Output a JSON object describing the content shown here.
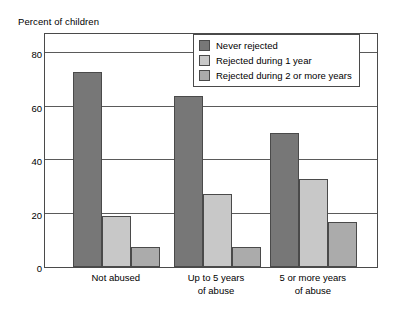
{
  "chart_data": {
    "type": "bar",
    "title": "",
    "ylabel": "Percent of children",
    "xlabel": "",
    "ylim": [
      0,
      88
    ],
    "yticks": [
      0,
      20,
      40,
      60,
      80
    ],
    "ytick_labels": [
      "0",
      "20",
      "40",
      "60",
      "80"
    ],
    "grid": true,
    "legend_position": "top-right inside plot area",
    "categories": [
      "Not abused",
      "Up to 5 years of abuse",
      "5 or more years of abuse"
    ],
    "category_lines": [
      [
        "Not abused"
      ],
      [
        "Up to 5 years",
        "of abuse"
      ],
      [
        "5 or more years",
        "of abuse"
      ]
    ],
    "series": [
      {
        "name": "Never rejected",
        "color": "#777777",
        "values": [
          73,
          64,
          50
        ]
      },
      {
        "name": "Rejected during 1 year",
        "color": "#c8c8c8",
        "values": [
          19,
          27.5,
          33
        ]
      },
      {
        "name": "Rejected during 2 or more years",
        "color": "#ababab",
        "values": [
          7.5,
          7.5,
          17
        ]
      }
    ]
  },
  "colors": {
    "frame": "#4a4a4a",
    "gridline": "#5a5a5a",
    "background": "#ffffff",
    "text": "#000000"
  }
}
